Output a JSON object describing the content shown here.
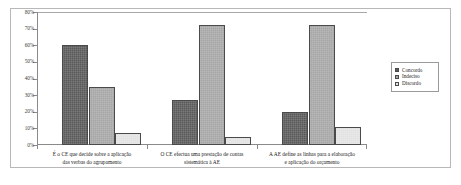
{
  "chart_data": {
    "type": "bar",
    "title": "",
    "subtitle": "",
    "xlabel": "",
    "ylabel": "",
    "ylim": [
      0,
      80
    ],
    "y_tick_labels": [
      "80%",
      "70%",
      "60%",
      "50%",
      "40%",
      "30%",
      "20%",
      "10%",
      "0%"
    ],
    "y_tick_values": [
      80,
      70,
      60,
      50,
      40,
      30,
      20,
      10,
      0
    ],
    "grid": "top-line-only",
    "legend_position": "right",
    "categories": [
      {
        "line1": "É o CE que decide sobre a aplicação",
        "line2": "das verbas do agrupamento"
      },
      {
        "line1": "O CE efectua uma prestação de contas",
        "line2": "sistemática à AE"
      },
      {
        "line1": "A AE define as linhas para a elaboração",
        "line2": "e aplicação do orçamento"
      }
    ],
    "series": [
      {
        "name": "Concordo",
        "color": "#595959",
        "values": [
          60,
          27,
          20
        ]
      },
      {
        "name": "Indeciso",
        "color": "#a6a6a6",
        "values": [
          35,
          72,
          72
        ]
      },
      {
        "name": "Discordo",
        "color": "#e2e2e2",
        "values": [
          7,
          5,
          11
        ]
      }
    ]
  },
  "legend": {
    "items": [
      {
        "label": "Concordo"
      },
      {
        "label": "Indeciso"
      },
      {
        "label": "Discordo"
      }
    ]
  },
  "axis": {
    "y_labels": [
      "80%",
      "70%",
      "60%",
      "50%",
      "40%",
      "30%",
      "20%",
      "10%",
      "0%"
    ]
  },
  "x_axis": {
    "labels": [
      {
        "line1": "É o CE que decide sobre a aplicação",
        "line2": "das verbas do agrupamento"
      },
      {
        "line1": "O CE efectua uma prestação de contas",
        "line2": "sistemática à AE"
      },
      {
        "line1": "A AE define as linhas para a elaboração",
        "line2": "e aplicação do orçamento"
      }
    ]
  }
}
